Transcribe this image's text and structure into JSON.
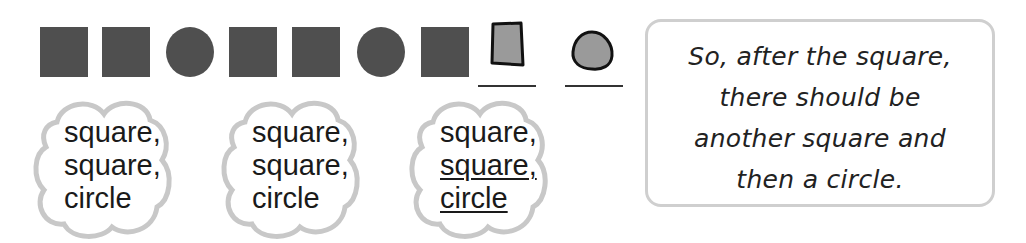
{
  "sequence": {
    "shapes": [
      {
        "type": "square",
        "style": "filled"
      },
      {
        "type": "square",
        "style": "filled"
      },
      {
        "type": "circle",
        "style": "filled"
      },
      {
        "type": "square",
        "style": "filled"
      },
      {
        "type": "square",
        "style": "filled"
      },
      {
        "type": "circle",
        "style": "filled"
      },
      {
        "type": "square",
        "style": "filled"
      },
      {
        "type": "square",
        "style": "drawn-answer"
      },
      {
        "type": "circle",
        "style": "drawn-answer"
      }
    ],
    "fill_color": "#4f4f4f",
    "answer_fill_color": "#9a9a9a"
  },
  "clouds": [
    {
      "lines": [
        "square,",
        "square,",
        "circle"
      ],
      "underlined": [
        false,
        false,
        false
      ]
    },
    {
      "lines": [
        "square,",
        "square,",
        "circle"
      ],
      "underlined": [
        false,
        false,
        false
      ]
    },
    {
      "lines": [
        "square,",
        "square,",
        "circle"
      ],
      "underlined": [
        false,
        true,
        true
      ]
    }
  ],
  "note": {
    "lines": [
      "So, after the square,",
      "there should be",
      "another square and",
      "then a circle."
    ]
  }
}
